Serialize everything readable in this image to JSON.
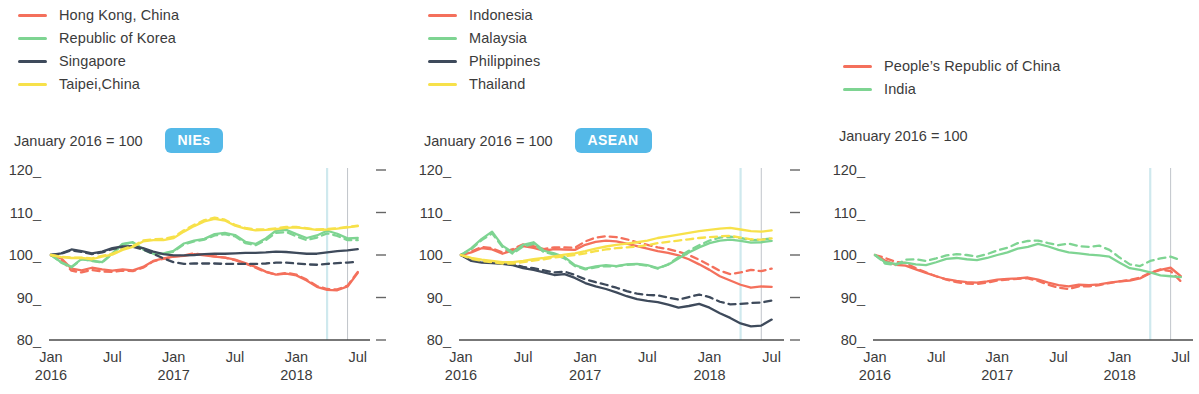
{
  "colors": {
    "red": "#F4705C",
    "green": "#7ED492",
    "navy": "#3E4A5B",
    "yellow": "#F7E14A",
    "badge_bg": "#54B9E8",
    "badge_text": "#FFFFFF",
    "axis": "#4A4A4A",
    "gridline_cyan": "#CFE9EE",
    "gridline_gray": "#B9BDC4",
    "text": "#3B3B3B"
  },
  "panels": [
    {
      "id": "nies",
      "badge": "NIEs",
      "subtitle": "January 2016 = 100",
      "legend": [
        {
          "label": "Hong Kong, China",
          "color": "#F4705C"
        },
        {
          "label": "Republic of Korea",
          "color": "#7ED492"
        },
        {
          "label": "Singapore",
          "color": "#3E4A5B"
        },
        {
          "label": "Taipei,China",
          "color": "#F7E14A"
        }
      ]
    },
    {
      "id": "asean",
      "badge": "ASEAN",
      "subtitle": "January 2016 = 100",
      "legend": [
        {
          "label": "Indonesia",
          "color": "#F4705C"
        },
        {
          "label": "Malaysia",
          "color": "#7ED492"
        },
        {
          "label": "Philippines",
          "color": "#3E4A5B"
        },
        {
          "label": "Thailand",
          "color": "#F7E14A"
        }
      ]
    },
    {
      "id": "prc",
      "badge": "",
      "subtitle": "January 2016 = 100",
      "legend": [
        {
          "label": "People’s Republic of China",
          "color": "#F4705C"
        },
        {
          "label": "India",
          "color": "#7ED492"
        }
      ]
    }
  ],
  "axis": {
    "yticks": [
      120,
      110,
      100,
      90,
      80
    ],
    "ylim": [
      80,
      120
    ],
    "xticks": [
      {
        "month": "Jan",
        "year": "2016",
        "index": 0
      },
      {
        "month": "Jul",
        "year": "",
        "index": 6
      },
      {
        "month": "Jan",
        "year": "2017",
        "index": 12
      },
      {
        "month": "Jul",
        "year": "",
        "index": 18
      },
      {
        "month": "Jan",
        "year": "2018",
        "index": 24
      },
      {
        "month": "Jul",
        "year": "",
        "index": 30
      }
    ],
    "xlim": [
      0,
      31
    ],
    "grid": false,
    "vlines": [
      27,
      29
    ]
  },
  "chart_data": [
    {
      "type": "line",
      "title": "NIEs",
      "subtitle": "January 2016 = 100",
      "xlabel": "",
      "ylabel": "",
      "ylim": [
        80,
        120
      ],
      "legend_position": "top-left",
      "x": [
        "Jan 2016",
        "Feb 2016",
        "Mar 2016",
        "Apr 2016",
        "May 2016",
        "Jun 2016",
        "Jul 2016",
        "Aug 2016",
        "Sep 2016",
        "Oct 2016",
        "Nov 2016",
        "Dec 2016",
        "Jan 2017",
        "Feb 2017",
        "Mar 2017",
        "Apr 2017",
        "May 2017",
        "Jun 2017",
        "Jul 2017",
        "Aug 2017",
        "Sep 2017",
        "Oct 2017",
        "Nov 2017",
        "Dec 2017",
        "Jan 2018",
        "Feb 2018",
        "Mar 2018",
        "Apr 2018",
        "May 2018",
        "Jun 2018",
        "Jul 2018"
      ],
      "series": [
        {
          "name": "Hong Kong, China",
          "color": "#F4705C",
          "style": "solid",
          "values": [
            100.0,
            99.2,
            96.8,
            96.4,
            97.0,
            96.6,
            96.3,
            96.6,
            96.4,
            97.2,
            98.6,
            99.2,
            99.6,
            99.8,
            100.2,
            99.9,
            99.6,
            99.4,
            98.9,
            98.1,
            97.2,
            96.1,
            95.4,
            95.6,
            95.2,
            94.0,
            92.5,
            91.8,
            91.7,
            92.6,
            95.8
          ]
        },
        {
          "name": "Hong Kong, China",
          "color": "#F4705C",
          "style": "dashed",
          "values": [
            100.0,
            98.9,
            96.3,
            95.9,
            96.5,
            96.1,
            96.0,
            96.3,
            96.2,
            97.0,
            98.5,
            99.1,
            99.6,
            99.9,
            100.4,
            100.0,
            99.7,
            99.4,
            98.8,
            98.0,
            97.0,
            96.0,
            95.4,
            95.8,
            95.4,
            94.2,
            92.7,
            92.0,
            91.9,
            92.8,
            96.0
          ]
        },
        {
          "name": "Republic of Korea",
          "color": "#7ED492",
          "style": "solid",
          "values": [
            100.0,
            98.3,
            97.2,
            99.1,
            98.7,
            98.3,
            100.4,
            102.6,
            103.0,
            101.4,
            100.3,
            100.4,
            101.0,
            102.7,
            103.4,
            103.8,
            104.9,
            105.2,
            104.7,
            103.1,
            102.6,
            103.9,
            105.7,
            105.9,
            104.9,
            104.0,
            104.6,
            105.7,
            105.0,
            103.9,
            104.0
          ]
        },
        {
          "name": "Republic of Korea",
          "color": "#7ED492",
          "style": "dashed",
          "values": [
            100.0,
            98.2,
            97.1,
            99.0,
            98.6,
            98.2,
            100.3,
            102.5,
            102.9,
            101.3,
            100.2,
            100.3,
            100.8,
            102.5,
            103.2,
            103.6,
            104.6,
            104.9,
            104.4,
            102.8,
            102.3,
            103.5,
            105.2,
            105.4,
            104.4,
            103.5,
            104.1,
            105.1,
            104.5,
            103.5,
            103.5
          ]
        },
        {
          "name": "Singapore",
          "color": "#3E4A5B",
          "style": "solid",
          "values": [
            100.0,
            100.4,
            101.3,
            100.9,
            100.4,
            100.8,
            101.6,
            102.0,
            102.1,
            101.6,
            100.8,
            100.2,
            99.9,
            99.9,
            100.0,
            100.2,
            100.3,
            100.3,
            100.4,
            100.5,
            100.5,
            100.6,
            100.8,
            100.7,
            100.5,
            100.3,
            100.3,
            100.6,
            100.9,
            101.1,
            101.4
          ]
        },
        {
          "name": "Singapore",
          "color": "#3E4A5B",
          "style": "dashed",
          "values": [
            100.0,
            100.3,
            101.1,
            100.7,
            100.2,
            100.6,
            101.4,
            101.8,
            101.9,
            101.3,
            100.3,
            99.2,
            98.3,
            97.9,
            98.0,
            98.0,
            98.0,
            97.9,
            97.9,
            97.9,
            97.9,
            98.0,
            98.2,
            98.2,
            98.0,
            97.8,
            97.7,
            97.9,
            98.1,
            98.2,
            98.4
          ]
        },
        {
          "name": "Taipei,China",
          "color": "#F7E14A",
          "style": "solid",
          "values": [
            100.0,
            99.5,
            99.3,
            99.3,
            99.0,
            99.6,
            100.1,
            101.2,
            101.9,
            103.2,
            103.5,
            103.5,
            104.0,
            105.5,
            106.8,
            107.9,
            108.5,
            108.1,
            106.9,
            106.2,
            105.8,
            105.9,
            106.1,
            106.4,
            106.5,
            106.2,
            105.9,
            106.0,
            106.2,
            106.5,
            106.8
          ]
        },
        {
          "name": "Taipei,China",
          "color": "#F7E14A",
          "style": "dashed",
          "values": [
            100.0,
            99.6,
            99.4,
            99.4,
            99.2,
            99.8,
            100.3,
            101.4,
            102.1,
            103.4,
            103.7,
            103.8,
            104.3,
            105.8,
            107.1,
            108.2,
            108.8,
            108.3,
            107.1,
            106.4,
            106.0,
            106.0,
            106.3,
            106.6,
            106.6,
            106.3,
            106.0,
            106.1,
            106.3,
            106.6,
            106.9
          ]
        }
      ]
    },
    {
      "type": "line",
      "title": "ASEAN",
      "subtitle": "January 2016 = 100",
      "xlabel": "",
      "ylabel": "",
      "ylim": [
        80,
        120
      ],
      "legend_position": "top-left",
      "x": [
        "Jan 2016",
        "Feb 2016",
        "Mar 2016",
        "Apr 2016",
        "May 2016",
        "Jun 2016",
        "Jul 2016",
        "Aug 2016",
        "Sep 2016",
        "Oct 2016",
        "Nov 2016",
        "Dec 2016",
        "Jan 2017",
        "Feb 2017",
        "Mar 2017",
        "Apr 2017",
        "May 2017",
        "Jun 2017",
        "Jul 2017",
        "Aug 2017",
        "Sep 2017",
        "Oct 2017",
        "Nov 2017",
        "Dec 2017",
        "Jan 2018",
        "Feb 2018",
        "Mar 2018",
        "Apr 2018",
        "May 2018",
        "Jun 2018",
        "Jul 2018"
      ],
      "series": [
        {
          "name": "Indonesia",
          "color": "#F4705C",
          "style": "solid",
          "values": [
            100.0,
            100.6,
            101.6,
            101.3,
            100.3,
            101.1,
            102.1,
            101.7,
            101.0,
            101.4,
            101.3,
            101.2,
            102.4,
            103.1,
            103.4,
            103.2,
            102.7,
            102.1,
            101.5,
            100.9,
            100.5,
            99.9,
            99.0,
            97.8,
            96.5,
            95.0,
            94.0,
            93.0,
            92.3,
            92.6,
            92.5
          ]
        },
        {
          "name": "Indonesia",
          "color": "#F4705C",
          "style": "dashed",
          "values": [
            100.0,
            100.8,
            101.9,
            101.6,
            100.6,
            101.4,
            102.5,
            102.1,
            101.4,
            101.8,
            101.8,
            101.7,
            103.2,
            104.1,
            104.4,
            104.2,
            103.7,
            103.0,
            102.4,
            101.8,
            101.4,
            100.8,
            100.0,
            98.9,
            97.6,
            96.3,
            95.5,
            95.9,
            96.5,
            96.2,
            96.8
          ]
        },
        {
          "name": "Malaysia",
          "color": "#7ED492",
          "style": "solid",
          "values": [
            100.0,
            101.6,
            103.8,
            105.5,
            102.2,
            100.6,
            102.4,
            103.0,
            101.0,
            100.4,
            99.5,
            97.6,
            96.8,
            97.3,
            97.6,
            97.4,
            97.8,
            97.9,
            97.6,
            96.9,
            97.7,
            99.2,
            100.6,
            101.8,
            102.8,
            103.4,
            103.6,
            103.3,
            102.9,
            103.0,
            103.3
          ]
        },
        {
          "name": "Malaysia",
          "color": "#7ED492",
          "style": "dashed",
          "values": [
            100.0,
            101.4,
            103.5,
            105.1,
            101.9,
            100.3,
            102.0,
            102.6,
            100.7,
            100.1,
            99.2,
            97.4,
            96.6,
            97.1,
            97.4,
            97.3,
            97.7,
            97.8,
            97.5,
            96.8,
            97.8,
            99.5,
            101.0,
            102.3,
            103.4,
            104.1,
            104.3,
            104.0,
            103.5,
            103.6,
            103.9
          ]
        },
        {
          "name": "Philippines",
          "color": "#3E4A5B",
          "style": "solid",
          "values": [
            100.0,
            98.6,
            98.2,
            98.1,
            97.9,
            97.6,
            96.9,
            96.5,
            95.9,
            95.3,
            95.5,
            94.6,
            93.4,
            92.6,
            92.0,
            91.2,
            90.3,
            89.6,
            89.2,
            88.9,
            88.3,
            87.6,
            88.0,
            88.5,
            87.6,
            86.3,
            85.2,
            83.9,
            83.2,
            83.4,
            84.8
          ]
        },
        {
          "name": "Philippines",
          "color": "#3E4A5B",
          "style": "dashed",
          "values": [
            100.0,
            98.8,
            98.5,
            98.4,
            98.2,
            97.9,
            97.2,
            96.9,
            96.4,
            95.9,
            96.1,
            95.3,
            94.3,
            93.6,
            93.0,
            92.3,
            91.5,
            90.9,
            90.6,
            90.5,
            90.0,
            89.5,
            90.1,
            90.7,
            90.1,
            89.0,
            88.4,
            88.5,
            88.7,
            88.8,
            89.3
          ]
        },
        {
          "name": "Thailand",
          "color": "#F7E14A",
          "style": "solid",
          "values": [
            100.0,
            99.3,
            98.9,
            98.6,
            98.3,
            98.3,
            98.6,
            99.0,
            99.3,
            99.7,
            100.1,
            100.4,
            100.9,
            101.5,
            102.0,
            102.4,
            102.7,
            103.0,
            103.4,
            104.0,
            104.4,
            104.8,
            105.2,
            105.6,
            105.9,
            106.2,
            106.4,
            106.0,
            105.6,
            105.5,
            105.8
          ]
        },
        {
          "name": "Thailand",
          "color": "#F7E14A",
          "style": "dashed",
          "values": [
            100.0,
            99.1,
            98.6,
            98.3,
            98.0,
            98.0,
            98.3,
            98.7,
            99.0,
            99.4,
            99.7,
            100.0,
            100.4,
            100.9,
            101.3,
            101.6,
            101.8,
            102.0,
            102.3,
            102.8,
            103.1,
            103.4,
            103.7,
            104.0,
            104.2,
            104.4,
            104.5,
            104.1,
            103.7,
            103.6,
            103.9
          ]
        }
      ]
    },
    {
      "type": "line",
      "title": "",
      "subtitle": "January 2016 = 100",
      "xlabel": "",
      "ylabel": "",
      "ylim": [
        80,
        120
      ],
      "legend_position": "top-left",
      "x": [
        "Jan 2016",
        "Feb 2016",
        "Mar 2016",
        "Apr 2016",
        "May 2016",
        "Jun 2016",
        "Jul 2016",
        "Aug 2016",
        "Sep 2016",
        "Oct 2016",
        "Nov 2016",
        "Dec 2016",
        "Jan 2017",
        "Feb 2017",
        "Mar 2017",
        "Apr 2017",
        "May 2017",
        "Jun 2017",
        "Jul 2017",
        "Aug 2017",
        "Sep 2017",
        "Oct 2017",
        "Nov 2017",
        "Dec 2017",
        "Jan 2018",
        "Feb 2018",
        "Mar 2018",
        "Apr 2018",
        "May 2018",
        "Jun 2018",
        "Jul 2018"
      ],
      "series": [
        {
          "name": "People’s Republic of China",
          "color": "#F4705C",
          "style": "solid",
          "values": [
            100.0,
            98.7,
            97.7,
            97.5,
            96.6,
            95.8,
            95.0,
            94.3,
            93.9,
            93.6,
            93.5,
            93.8,
            94.2,
            94.4,
            94.5,
            94.7,
            94.2,
            93.5,
            92.9,
            92.6,
            93.0,
            92.9,
            93.1,
            93.5,
            93.8,
            94.0,
            94.5,
            95.7,
            96.5,
            97.0,
            95.0
          ]
        },
        {
          "name": "People’s Republic of China",
          "color": "#F4705C",
          "style": "dashed",
          "values": [
            100.0,
            99.3,
            98.4,
            98.1,
            96.9,
            95.9,
            95.0,
            94.2,
            93.6,
            93.3,
            93.2,
            93.5,
            94.0,
            94.2,
            94.4,
            94.5,
            93.9,
            93.0,
            92.3,
            92.0,
            92.6,
            92.6,
            92.9,
            93.4,
            93.8,
            94.1,
            94.7,
            95.8,
            96.6,
            96.2,
            93.8
          ]
        },
        {
          "name": "India",
          "color": "#7ED492",
          "style": "solid",
          "values": [
            100.0,
            98.3,
            97.9,
            98.2,
            97.8,
            97.6,
            98.3,
            99.1,
            99.3,
            99.0,
            98.8,
            99.3,
            100.0,
            100.6,
            101.5,
            101.9,
            102.6,
            102.0,
            101.2,
            100.6,
            100.4,
            100.1,
            99.9,
            99.6,
            98.2,
            96.9,
            96.5,
            95.9,
            95.2,
            95.0,
            94.8
          ]
        },
        {
          "name": "India",
          "color": "#7ED492",
          "style": "dashed",
          "values": [
            100.0,
            98.0,
            97.6,
            98.9,
            99.0,
            98.6,
            99.2,
            99.9,
            100.2,
            100.0,
            99.6,
            100.2,
            101.1,
            101.7,
            102.8,
            103.3,
            103.4,
            102.8,
            102.3,
            102.7,
            102.1,
            101.9,
            102.2,
            101.2,
            99.4,
            97.8,
            97.4,
            98.6,
            99.2,
            99.6,
            98.8
          ]
        }
      ]
    }
  ]
}
